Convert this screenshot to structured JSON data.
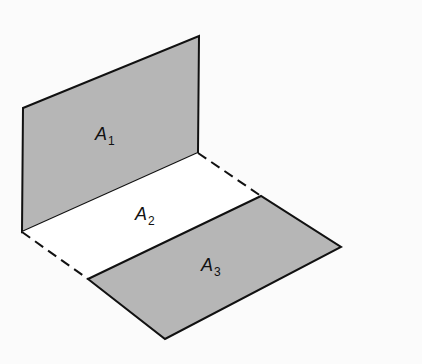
{
  "diagram": {
    "colors": {
      "background": "#fbfbfb",
      "shaded_fill": "#b6b6b6",
      "unshaded_fill": "#ffffff",
      "stroke": "#111111"
    },
    "regions": [
      {
        "id": "A1",
        "label": "A",
        "subscript": "1",
        "shaded": true
      },
      {
        "id": "A2",
        "label": "A",
        "subscript": "2",
        "shaded": false
      },
      {
        "id": "A3",
        "label": "A",
        "subscript": "3",
        "shaded": true
      }
    ],
    "edges": {
      "solid": "region outlines",
      "dashed": "outer sides of A2"
    }
  }
}
